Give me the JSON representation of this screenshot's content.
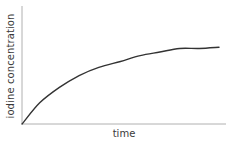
{
  "chart_data": {
    "type": "line",
    "title": "",
    "xlabel": "time",
    "ylabel": "iodine concentration",
    "x_ticks": [],
    "y_ticks": [],
    "grid": false,
    "legend": null,
    "xlim": [
      0,
      1
    ],
    "ylim": [
      0,
      1
    ],
    "series": [
      {
        "name": "iodine concentration",
        "color": "#333333",
        "x": [
          0,
          0.09,
          0.19,
          0.29,
          0.39,
          0.5,
          0.6,
          0.7,
          0.8,
          0.9,
          1.0
        ],
        "values": [
          0,
          0.18,
          0.31,
          0.41,
          0.48,
          0.53,
          0.58,
          0.61,
          0.64,
          0.64,
          0.65
        ]
      }
    ]
  },
  "colors": {
    "axis": "#b0b0b0",
    "curve": "#333333",
    "text": "#3a3a3a"
  }
}
